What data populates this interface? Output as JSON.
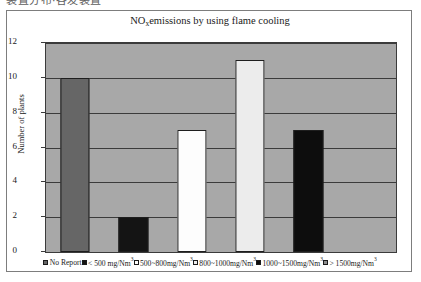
{
  "document": {
    "top_cut_text": "装置分布·各发装置"
  },
  "chart_data": {
    "type": "bar",
    "title_main": "NO",
    "title_sub": "x",
    "title_rest": "emissions by using flame cooling",
    "xlabel": "",
    "ylabel": "Number of plants",
    "ylim": [
      0,
      12
    ],
    "yticks": [
      12,
      10,
      8,
      6,
      4,
      2,
      0
    ],
    "grid": true,
    "legend_position": "bottom",
    "plot_background": "#a8a8a8",
    "categories": [
      "No Report",
      "< 500 mg/Nm3",
      "500~800mg/Nm3",
      "800~1000mg/Nm3",
      "1000~1500mg/Nm3",
      "> 1500mg/Nm3"
    ],
    "values": [
      10,
      2,
      7,
      11,
      7,
      0
    ],
    "colors": [
      "#666666",
      "#141414",
      "#fdfdfd",
      "#ececec",
      "#0d0d0d",
      "#8f8f8f"
    ],
    "legend": [
      {
        "label_main": "No Report",
        "label_sup": "",
        "swatch": "#666666"
      },
      {
        "label_main": "< 500 mg/Nm",
        "label_sup": "3",
        "swatch": "#141414"
      },
      {
        "label_main": "500~800mg/Nm",
        "label_sup": "3",
        "swatch": "#fdfdfd"
      },
      {
        "label_main": "800~1000mg/Nm",
        "label_sup": "3",
        "swatch": "#ececec"
      },
      {
        "label_main": "1000~1500mg/Nm",
        "label_sup": "3",
        "swatch": "#0d0d0d"
      },
      {
        "label_main": "> 1500mg/Nm",
        "label_sup": "3",
        "swatch": "#8f8f8f"
      }
    ]
  }
}
